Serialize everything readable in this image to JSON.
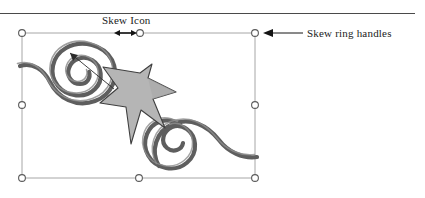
{
  "figure": {
    "type": "vector-shape-selection-illustration",
    "background_color": "#ffffff",
    "rule": {
      "name": "top-horizontal-rule",
      "color": "#4a4a4a"
    },
    "shape": {
      "name": "star-with-spirals",
      "fill_color": "#b3b3b3",
      "outline_color": "#3c3c3c",
      "spiral_color": "#595959",
      "spiral_count": 2
    },
    "selection": {
      "box_color": "#9a9a9a",
      "handle_fill": "#ffffff",
      "handle_stroke": "#5a5a5a",
      "handle_count": 7,
      "handles": [
        {
          "name": "handle-top-left",
          "x": 22,
          "y": 33
        },
        {
          "name": "handle-top-center",
          "x": 139,
          "y": 33
        },
        {
          "name": "handle-top-right",
          "x": 255,
          "y": 33
        },
        {
          "name": "handle-middle-left",
          "x": 22,
          "y": 105
        },
        {
          "name": "handle-middle-right",
          "x": 255,
          "y": 105
        },
        {
          "name": "handle-bottom-left",
          "x": 22,
          "y": 178
        },
        {
          "name": "handle-bottom-center",
          "x": 139,
          "y": 178
        },
        {
          "name": "handle-bottom-right",
          "x": 255,
          "y": 178
        }
      ]
    }
  },
  "annotations": {
    "skew_icon": {
      "label": "Skew Icon",
      "icon_name": "double-headed-horizontal-arrow",
      "arrow_color": "#1a1a1a"
    },
    "skew_ring_handles": {
      "label": "Skew ring handles",
      "leader_name": "left-pointing-arrow",
      "arrow_color": "#1a1a1a"
    }
  }
}
